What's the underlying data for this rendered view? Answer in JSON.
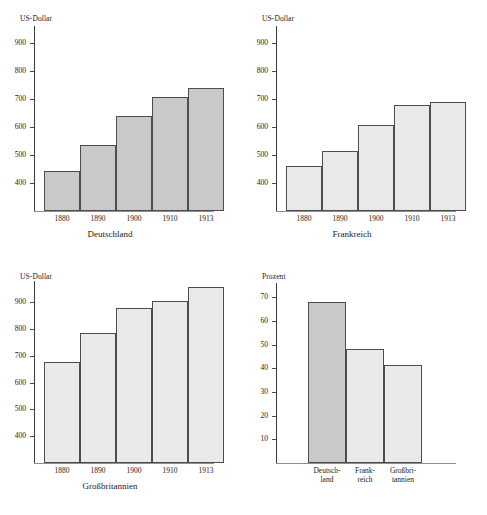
{
  "page": {
    "background": "#ffffff",
    "bar_fill_dark": "#c9c9c9",
    "bar_fill_light": "#e9e9e9",
    "bar_stroke": "#4d4d4d",
    "axis_color": "#3a3a3a"
  },
  "chart_data": [
    {
      "type": "bar",
      "id": "deutschland",
      "title": "Deutschland",
      "ylabel": "US-Dollar",
      "xlabel": "",
      "categories": [
        "1880",
        "1890",
        "1900",
        "1910",
        "1913"
      ],
      "values": [
        443,
        535,
        640,
        706,
        740
      ],
      "yticks": [
        400,
        500,
        600,
        700,
        800,
        900
      ],
      "ylim": [
        300,
        960
      ],
      "grid": false,
      "legend": "none",
      "bar_colors": [
        "#c9c9c9",
        "#c9c9c9",
        "#c9c9c9",
        "#c9c9c9",
        "#c9c9c9"
      ]
    },
    {
      "type": "bar",
      "id": "frankreich",
      "title": "Frankreich",
      "ylabel": "US-Dollar",
      "xlabel": "",
      "categories": [
        "1880",
        "1890",
        "1900",
        "1910",
        "1913"
      ],
      "values": [
        462,
        513,
        608,
        678,
        688
      ],
      "yticks": [
        400,
        500,
        600,
        700,
        800,
        900
      ],
      "ylim": [
        300,
        960
      ],
      "grid": false,
      "legend": "none",
      "bar_colors": [
        "#e9e9e9",
        "#e9e9e9",
        "#e9e9e9",
        "#e9e9e9",
        "#e9e9e9"
      ]
    },
    {
      "type": "bar",
      "id": "grossbritannien",
      "title": "Großbritannien",
      "ylabel": "US-Dollar",
      "xlabel": "",
      "categories": [
        "1880",
        "1890",
        "1900",
        "1910",
        "1913"
      ],
      "values": [
        677,
        786,
        878,
        905,
        958
      ],
      "yticks": [
        400,
        500,
        600,
        700,
        800,
        900
      ],
      "ylim": [
        300,
        980
      ],
      "grid": false,
      "legend": "none",
      "bar_colors": [
        "#e9e9e9",
        "#e9e9e9",
        "#e9e9e9",
        "#e9e9e9",
        "#e9e9e9"
      ]
    },
    {
      "type": "bar",
      "id": "prozent",
      "title": "",
      "ylabel": "Prozent",
      "xlabel": "",
      "categories": [
        "Deutsch-\nland",
        "Frank-\nreich",
        "Großbri-\ntannien"
      ],
      "category_lines": [
        [
          "Deutsch-",
          "land"
        ],
        [
          "Frank-",
          "reich"
        ],
        [
          "Großbri-",
          "tannien"
        ]
      ],
      "values": [
        68,
        48,
        41.5
      ],
      "yticks": [
        10,
        20,
        30,
        40,
        50,
        60,
        70
      ],
      "ylim": [
        0,
        76
      ],
      "grid": false,
      "legend": "none",
      "bar_colors": [
        "#c9c9c9",
        "#e9e9e9",
        "#e9e9e9"
      ]
    }
  ]
}
